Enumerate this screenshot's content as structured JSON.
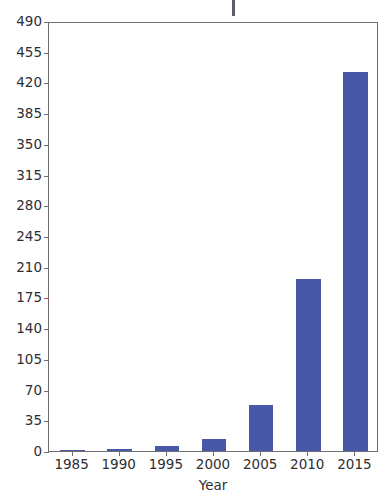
{
  "chart_data": {
    "type": "bar",
    "title": "",
    "xlabel": "Year",
    "ylabel": "",
    "categories": [
      "1985",
      "1990",
      "1995",
      "2000",
      "2005",
      "2010",
      "2015"
    ],
    "values": [
      1,
      2,
      6,
      14,
      52,
      196,
      432
    ],
    "ylim": [
      0,
      490
    ],
    "yticks": [
      0,
      35,
      70,
      105,
      140,
      175,
      210,
      245,
      280,
      315,
      350,
      385,
      420,
      455,
      490
    ],
    "ytick_labels": [
      "0",
      "35",
      "70",
      "105",
      "140",
      "175",
      "210",
      "245",
      "280",
      "315",
      "350",
      "385",
      "420",
      "455",
      "490"
    ],
    "xtick_labels": [
      "1985",
      "1990",
      "1995",
      "2000",
      "2005",
      "2010",
      "2015"
    ],
    "grid": false,
    "legend": null,
    "bar_color": "#4758a8",
    "axis_color": "#6f6f72",
    "text_color": "#2e2e33",
    "highlight_tick_color": "#c94a3a",
    "highlight_tick_value": "175"
  },
  "axis": {
    "x_title": "Year"
  }
}
